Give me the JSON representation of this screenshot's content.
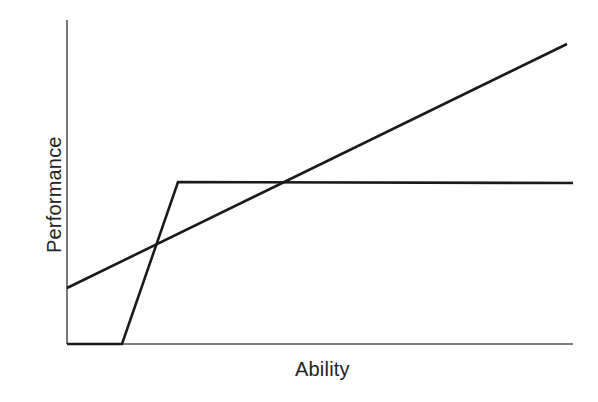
{
  "figure": {
    "background_color": "#ffffff",
    "width": 598,
    "height": 402
  },
  "axes": {
    "xlabel": "Ability",
    "ylabel": "Performance",
    "axis_color": "#555555",
    "axis_line_width": 1.6,
    "show_ticks": false,
    "show_gridlines": false,
    "show_tick_labels": false,
    "show_title": false,
    "show_legend": false,
    "spines": {
      "left": true,
      "bottom": true,
      "top": false,
      "right": false
    },
    "pixel_geometry": {
      "origin_x": 67,
      "origin_y": 344,
      "x_axis_end_x": 573,
      "y_axis_top_y": 20
    }
  },
  "chart_data": {
    "type": "line",
    "title": "",
    "subtitle": "",
    "xlabel": "Ability",
    "ylabel": "Performance",
    "xlim": [
      0,
      100
    ],
    "ylim": [
      0,
      100
    ],
    "grid": false,
    "legend": false,
    "legend_position": "none",
    "tick_labels": {
      "x": [],
      "y": []
    },
    "annotations": [],
    "series": [
      {
        "name": "threshold-step-curve",
        "description": "Flat at zero until a threshold ability, then a steep linear rise to a ceiling, then constant at the ceiling.",
        "color": "#1a1a1a",
        "line_width": 2.6,
        "marker": "none",
        "x": [
          0,
          11,
          22,
          100
        ],
        "y": [
          0,
          0,
          50,
          50
        ],
        "pixel_points": [
          [
            67,
            344
          ],
          [
            122,
            344
          ],
          [
            178,
            182
          ],
          [
            573,
            183
          ]
        ]
      },
      {
        "name": "linear-increasing-curve",
        "description": "Straight line increasing steadily with ability across the whole range.",
        "color": "#1a1a1a",
        "line_width": 2.6,
        "marker": "none",
        "x": [
          0,
          100
        ],
        "y": [
          17,
          93
        ],
        "pixel_points": [
          [
            67,
            288
          ],
          [
            567,
            44
          ]
        ]
      }
    ],
    "intersections": [
      {
        "name": "crossing-on-rising-limb",
        "pixel_point": [
          155,
          245
        ]
      },
      {
        "name": "crossing-on-plateau",
        "pixel_point": [
          290,
          183
        ]
      }
    ]
  }
}
